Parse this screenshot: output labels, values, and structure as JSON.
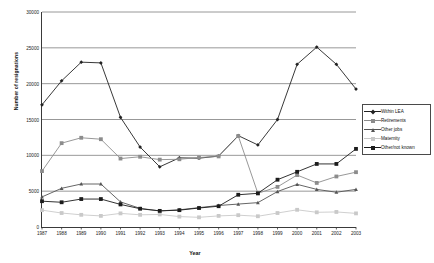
{
  "chart_data": {
    "type": "line",
    "title": "",
    "xlabel": "Year",
    "ylabel": "Number of resignations",
    "categories": [
      "1987",
      "1988",
      "1989",
      "1990",
      "1991",
      "1992",
      "1993",
      "1994",
      "1995",
      "1996",
      "1997",
      "1998",
      "1999",
      "2000",
      "2001",
      "2002",
      "2003"
    ],
    "x": [
      1987,
      1988,
      1989,
      1990,
      1991,
      1992,
      1993,
      1994,
      1995,
      1996,
      1997,
      1998,
      1999,
      2000,
      2001,
      2002,
      2003
    ],
    "ylim": [
      0,
      30000
    ],
    "yticks": [
      0,
      5000,
      10000,
      15000,
      20000,
      25000,
      30000
    ],
    "ytick_labels": [
      "0",
      "5000",
      "10000",
      "15000",
      "20000",
      "25000",
      "30000"
    ],
    "grid": "horizontal",
    "legend_position": "right",
    "series": [
      {
        "name": "Within LEA",
        "color": "#222222",
        "marker": "diamond",
        "values": [
          17050,
          20400,
          23000,
          22900,
          15300,
          11150,
          8400,
          9650,
          9600,
          9900,
          12750,
          11450,
          15000,
          22700,
          25100,
          22700,
          19250
        ]
      },
      {
        "name": "Retirements",
        "color": "#8c8c8c",
        "marker": "square",
        "values": [
          7800,
          11700,
          12450,
          12250,
          9550,
          9800,
          9400,
          9450,
          9700,
          9850,
          12700,
          4700,
          5600,
          7250,
          6150,
          7050,
          7650
        ]
      },
      {
        "name": "Other jobs",
        "color": "#555555",
        "marker": "triangle",
        "values": [
          4200,
          5400,
          6000,
          6000,
          3500,
          2600,
          2250,
          2400,
          2700,
          3000,
          3200,
          3400,
          4950,
          5950,
          5250,
          4850,
          5250
        ]
      },
      {
        "name": "Maternity",
        "color": "#c9c9c9",
        "marker": "square",
        "values": [
          2350,
          1950,
          1700,
          1550,
          1900,
          1700,
          1750,
          1450,
          1350,
          1550,
          1650,
          1500,
          1950,
          2400,
          2050,
          2100,
          1900
        ]
      },
      {
        "name": "Other/not known",
        "color": "#1c1c1c",
        "marker": "square",
        "values": [
          3600,
          3450,
          3900,
          3900,
          3150,
          2550,
          2250,
          2350,
          2650,
          2900,
          4500,
          4700,
          6600,
          7700,
          8800,
          8800,
          10900
        ]
      }
    ]
  },
  "legend": {
    "items": [
      {
        "label": "Within LEA"
      },
      {
        "label": "Retirements"
      },
      {
        "label": "Other jobs"
      },
      {
        "label": "Maternity"
      },
      {
        "label": "Other/not known"
      }
    ]
  },
  "axes": {
    "y_title": "Number of resignations",
    "x_title": "Year"
  }
}
